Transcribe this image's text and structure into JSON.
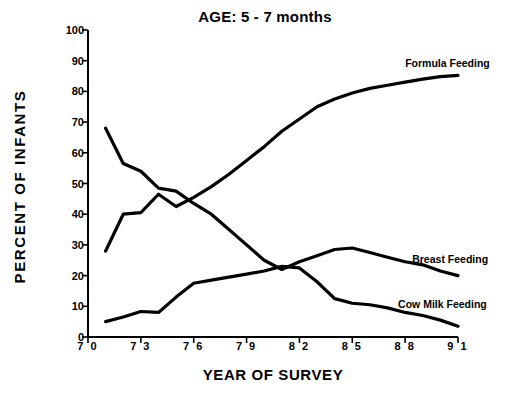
{
  "chart_data": {
    "type": "line",
    "title": "AGE: 5 - 7 months",
    "xlabel": "YEAR OF SURVEY",
    "ylabel": "PERCENT OF INFANTS",
    "xlim": [
      70,
      91
    ],
    "ylim": [
      0,
      100
    ],
    "grid": false,
    "legend_position": "right-inline",
    "xticks": [
      "7 0",
      "7 3",
      "7 6",
      "7 9",
      "8 2",
      "8 5",
      "8 8",
      "9 1"
    ],
    "xtick_values": [
      70,
      73,
      76,
      79,
      82,
      85,
      88,
      91
    ],
    "yticks": [
      "0",
      "10",
      "20",
      "30",
      "40",
      "50",
      "60",
      "70",
      "80",
      "90",
      "100"
    ],
    "ytick_values": [
      0,
      10,
      20,
      30,
      40,
      50,
      60,
      70,
      80,
      90,
      100
    ],
    "x": [
      71,
      72,
      73,
      74,
      75,
      76,
      77,
      78,
      79,
      80,
      81,
      82,
      83,
      84,
      85,
      86,
      87,
      88,
      89,
      90,
      91
    ],
    "series": [
      {
        "name": "Formula Feeding",
        "color": "#000000",
        "values": [
          28,
          40,
          40.5,
          46.5,
          42.5,
          45.5,
          49,
          53,
          57.5,
          62,
          67,
          71,
          75,
          77.5,
          79.5,
          81,
          82,
          83,
          84,
          84.8,
          85.2
        ]
      },
      {
        "name": "Breast Feeding",
        "color": "#000000",
        "values": [
          68,
          56.5,
          54,
          48.5,
          47.5,
          43.5,
          40,
          35,
          30,
          25,
          22,
          24.5,
          26.5,
          28.5,
          29,
          27.5,
          26,
          24.5,
          23.5,
          21.5,
          20
        ]
      },
      {
        "name": "Cow Milk Feeding",
        "color": "#000000",
        "values": [
          5,
          6.5,
          8.3,
          8,
          13,
          17.5,
          18.5,
          19.5,
          20.5,
          21.5,
          23,
          22.5,
          18,
          12.5,
          11,
          10.5,
          9.5,
          8,
          7,
          5.5,
          3.5
        ]
      }
    ],
    "annotations": [
      {
        "label": "Formula Feeding",
        "x": 88,
        "y": 89
      },
      {
        "label": "Breast Feeding",
        "x": 88.4,
        "y": 25
      },
      {
        "label": "Cow Milk Feeding",
        "x": 87.6,
        "y": 10.5
      }
    ]
  }
}
